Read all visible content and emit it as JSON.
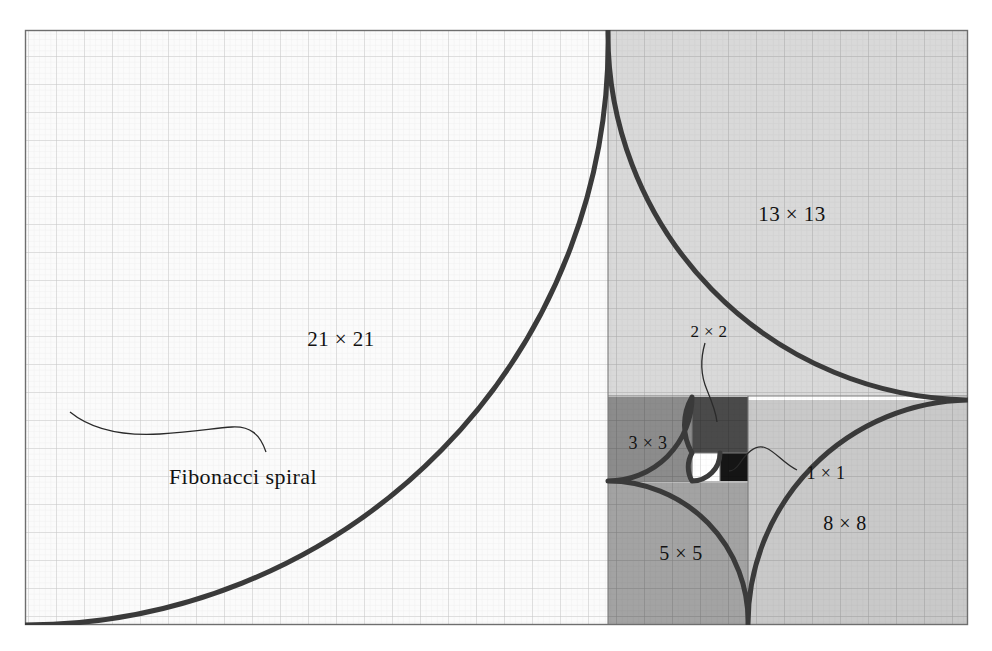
{
  "figure": {
    "title": "Fibonacci spiral",
    "background": "#ffffff",
    "frame": {
      "x": 25,
      "y": 30,
      "width": 943,
      "height": 595,
      "stroke": "#6e6e6e"
    },
    "grid": {
      "minor_step": 5.6,
      "major_step": 28,
      "minor_color": "#dcdcdc",
      "major_color": "#9a9a9a"
    },
    "spiral": {
      "stroke": "#3a3a3a",
      "stroke_width": 5,
      "turns": 6,
      "description": "Quarter-circle arcs inscribed in Fibonacci squares"
    },
    "leader_stroke": "#2a2a2a"
  },
  "annotations": {
    "spiral_caption": "Fibonacci spiral"
  },
  "squares": [
    {
      "name": "square-1x1-white",
      "label": "1 × 1",
      "size": 1,
      "fill": "#ffffff",
      "x": 692,
      "y": 453,
      "w": 28,
      "h": 28
    },
    {
      "name": "square-1x1-black",
      "label": "1 × 1",
      "size": 1,
      "fill": "#151515",
      "x": 720,
      "y": 453,
      "w": 28,
      "h": 28
    },
    {
      "name": "square-2x2",
      "label": "2 × 2",
      "size": 2,
      "fill": "#4a4a4a",
      "x": 692,
      "y": 397,
      "w": 56,
      "h": 56
    },
    {
      "name": "square-3x3",
      "label": "3 × 3",
      "size": 3,
      "fill": "#8c8c8c",
      "x": 608,
      "y": 397,
      "w": 84,
      "h": 84
    },
    {
      "name": "square-5x5",
      "label": "5 × 5",
      "size": 5,
      "fill": "#a3a3a3",
      "x": 608,
      "y": 483,
      "w": 140,
      "h": 141
    },
    {
      "name": "square-8x8",
      "label": "8 × 8",
      "size": 8,
      "fill": "#c9c9c9",
      "x": 748,
      "y": 400,
      "w": 220,
      "h": 224
    },
    {
      "name": "square-13x13",
      "label": "13 × 13",
      "size": 13,
      "fill": "#d9d9d9",
      "x": 608,
      "y": 30,
      "w": 360,
      "h": 366
    },
    {
      "name": "square-21x21",
      "label": "21 × 21",
      "size": 21,
      "fill": "#fbfbfb",
      "x": 25,
      "y": 30,
      "w": 583,
      "h": 594
    }
  ],
  "labels": {
    "s21": {
      "text": "21 × 21",
      "x": 341,
      "y": 339
    },
    "s13": {
      "text": "13 × 13",
      "x": 792,
      "y": 214
    },
    "s8": {
      "text": "8 × 8",
      "x": 845,
      "y": 523
    },
    "s5": {
      "text": "5 × 5",
      "x": 681,
      "y": 553
    },
    "s3": {
      "text": "3 × 3",
      "x": 648,
      "y": 443
    },
    "s2": {
      "text": "2 × 2",
      "x": 709,
      "y": 331
    },
    "s1": {
      "text": "1 × 1",
      "x": 826,
      "y": 473
    },
    "spiral": {
      "text": "Fibonacci spiral",
      "x": 243,
      "y": 477
    }
  },
  "colors": {
    "ink": "#121212",
    "spiral_line": "#3a3a3a",
    "frame_line": "#6e6e6e",
    "grid_minor": "#dcdcdc",
    "grid_major": "#9a9a9a"
  }
}
